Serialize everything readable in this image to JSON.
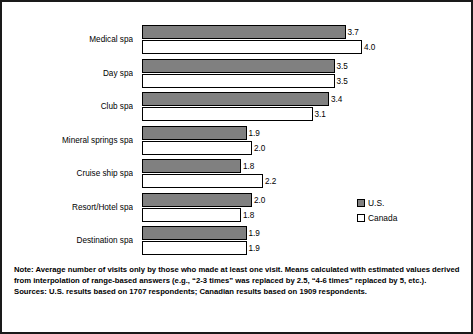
{
  "chart_data": {
    "type": "bar",
    "orientation": "horizontal",
    "title": "",
    "xlabel": "",
    "ylabel": "",
    "xlim": [
      0,
      4.0
    ],
    "grid": false,
    "legend_position": "right",
    "categories": [
      "Medical spa",
      "Day spa",
      "Club spa",
      "Mineral springs spa",
      "Cruise ship spa",
      "Resort/Hotel spa",
      "Destination spa"
    ],
    "series": [
      {
        "name": "U.S.",
        "color": "#808080",
        "values": [
          3.7,
          3.5,
          3.4,
          1.9,
          1.8,
          2.0,
          1.9
        ],
        "labels": [
          "3.7",
          "3.5",
          "3.4",
          "1.9",
          "1.8",
          "2.0",
          "1.9"
        ]
      },
      {
        "name": "Canada",
        "color": "#ffffff",
        "values": [
          4.0,
          3.5,
          3.1,
          2.0,
          2.2,
          1.8,
          1.9
        ],
        "labels": [
          "4.0",
          "3.5",
          "3.1",
          "2.0",
          "2.2",
          "1.8",
          "1.9"
        ]
      }
    ]
  },
  "legend": {
    "items": [
      {
        "label": "U.S."
      },
      {
        "label": "Canada"
      }
    ]
  },
  "footer": {
    "note": "Note: Average number of visits only by those who made at least one visit.  Means calculated with estimated values derived from interpolation of range-based answers (e.g., “2-3 times” was replaced by 2.5, “4-6 times” replaced by 5, etc.).",
    "sources": "Sources: U.S. results based on 1707 respondents; Canadian results based on 1909 respondents."
  }
}
